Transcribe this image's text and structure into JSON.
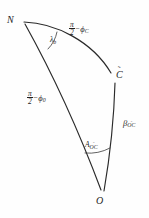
{
  "figure": {
    "kind": "spherical-triangle-diagram",
    "width": 149,
    "height": 218,
    "background_color": "#fefefe",
    "line_color": "#2a2a2a"
  },
  "vertices": [
    {
      "id": "N",
      "label": "N",
      "tilde": false,
      "x": 24,
      "y": 22
    },
    {
      "id": "Ctilde",
      "label": "C",
      "tilde": true,
      "x": 116,
      "y": 78
    },
    {
      "id": "O",
      "label": "O",
      "tilde": false,
      "x": 103,
      "y": 193
    }
  ],
  "angles": [
    {
      "id": "lambda-b",
      "at_vertex": "N",
      "symbol": "λ",
      "subscript": "b",
      "subscript_tilde": false,
      "label_text": "λ"
    },
    {
      "id": "A-OC",
      "at_vertex": "O",
      "symbol": "A",
      "subscript": "OC",
      "subscript_tilde": true,
      "label_text": "A"
    }
  ],
  "sides": [
    {
      "id": "side-N-Ctilde",
      "from": "N",
      "to": "Ctilde",
      "numerator": "π",
      "denominator": "2",
      "operator": "−",
      "term_symbol": "ϕ",
      "term_subscript": "C",
      "term_subscript_tilde": false,
      "full_text": "π/2 − ϕ_C"
    },
    {
      "id": "side-N-O",
      "from": "N",
      "to": "O",
      "numerator": "π",
      "denominator": "2",
      "operator": "−",
      "term_symbol": "ϕ",
      "term_subscript": "0",
      "term_subscript_tilde": false,
      "full_text": "π/2 − ϕ_0"
    },
    {
      "id": "side-Ctilde-O",
      "from": "Ctilde",
      "to": "O",
      "symbol": "β",
      "subscript": "OC",
      "subscript_tilde": true,
      "full_text": "β_OC̃"
    }
  ],
  "glyphs": {
    "tilde": "˜"
  }
}
